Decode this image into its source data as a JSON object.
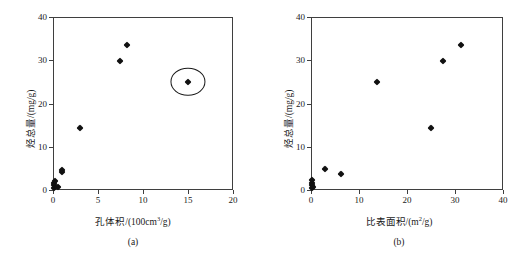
{
  "figure": {
    "background": "#ffffff",
    "marker_color": "#111111",
    "axis_color": "#3f3f3f",
    "panel_count": 2
  },
  "chart_data": [
    {
      "type": "scatter",
      "panel_label": "(a)",
      "title": "",
      "xlabel_parts": {
        "name": "孔体积",
        "sep": "/(100cm",
        "sup": "3",
        "tail": "/g)"
      },
      "xlabel": "孔体积/(100cm3/g)",
      "ylabel_parts": {
        "name": "烃总量",
        "tail": "/(mg/g)"
      },
      "ylabel": "烃总量/(mg/g)",
      "xlim": [
        0,
        20
      ],
      "ylim": [
        0,
        40
      ],
      "xticks": [
        0,
        5,
        10,
        15,
        20
      ],
      "yticks": [
        0,
        10,
        20,
        30,
        40
      ],
      "xticklabels": [
        "0",
        "5",
        "10",
        "15",
        "20"
      ],
      "yticklabels": [
        "0",
        "10",
        "20",
        "30",
        "40"
      ],
      "grid": false,
      "legend": false,
      "marker": "filled-diamond",
      "points": [
        {
          "x": 0.08,
          "y": 0.55
        },
        {
          "x": 0.12,
          "y": 1.05
        },
        {
          "x": 0.15,
          "y": 1.55
        },
        {
          "x": 0.18,
          "y": 2.15
        },
        {
          "x": 0.55,
          "y": 0.8
        },
        {
          "x": 0.95,
          "y": 4.15
        },
        {
          "x": 1.05,
          "y": 4.65
        },
        {
          "x": 3.0,
          "y": 14.25
        },
        {
          "x": 7.45,
          "y": 29.8
        },
        {
          "x": 8.2,
          "y": 33.5
        },
        {
          "x": 15.0,
          "y": 25.0
        }
      ],
      "annotations": [
        {
          "type": "ellipse",
          "name": "outlier-highlight",
          "center_x": 15.0,
          "center_y": 25.0,
          "width_data": 3.9,
          "height_data": 6.6
        }
      ]
    },
    {
      "type": "scatter",
      "panel_label": "(b)",
      "title": "",
      "xlabel_parts": {
        "name": "比表面积",
        "sep": "/(m",
        "sup": "2",
        "tail": "/g)"
      },
      "xlabel": "比表面积/(m2/g)",
      "ylabel_parts": {
        "name": "烃总量",
        "tail": "/(mg/g)"
      },
      "ylabel": "烃总量/(mg/g)",
      "xlim": [
        0,
        40
      ],
      "ylim": [
        0,
        40
      ],
      "xticks": [
        0,
        10,
        20,
        30,
        40
      ],
      "yticks": [
        0,
        10,
        20,
        30,
        40
      ],
      "xticklabels": [
        "0",
        "10",
        "20",
        "30",
        "40"
      ],
      "yticklabels": [
        "0",
        "10",
        "20",
        "30",
        "40"
      ],
      "grid": false,
      "legend": false,
      "marker": "filled-diamond",
      "points": [
        {
          "x": 0.15,
          "y": 0.55
        },
        {
          "x": 0.2,
          "y": 1.05
        },
        {
          "x": 0.25,
          "y": 1.6
        },
        {
          "x": 0.3,
          "y": 2.2
        },
        {
          "x": 0.45,
          "y": 0.8
        },
        {
          "x": 3.0,
          "y": 4.9
        },
        {
          "x": 6.2,
          "y": 3.8
        },
        {
          "x": 13.7,
          "y": 25.0
        },
        {
          "x": 24.9,
          "y": 14.25
        },
        {
          "x": 27.6,
          "y": 29.8
        },
        {
          "x": 31.3,
          "y": 33.5
        }
      ],
      "annotations": []
    }
  ]
}
